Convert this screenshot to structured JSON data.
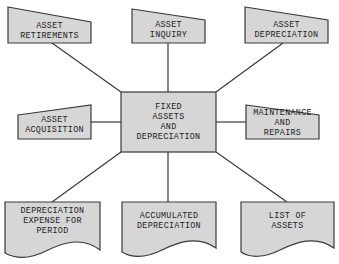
{
  "diagram": {
    "title": "Fixed Assets and Depreciation",
    "colors": {
      "shape_fill": "#d6d6d6",
      "stroke": "#3a3a3a",
      "text": "#222222",
      "background": "#ffffff"
    },
    "center": {
      "type": "process",
      "label": "FIXED\nASSETS\nAND\nDEPRECIATION"
    },
    "inputs": [
      {
        "id": "retirements",
        "type": "manual-input",
        "label": "ASSET\nRETIREMENTS"
      },
      {
        "id": "inquiry",
        "type": "manual-input",
        "label": "ASSET\nINQUIRY"
      },
      {
        "id": "depreciation",
        "type": "manual-input",
        "label": "ASSET\nDEPRECIATION"
      },
      {
        "id": "acquisition",
        "type": "manual-input",
        "label": "ASSET\nACQUISITION"
      },
      {
        "id": "maintenance",
        "type": "manual-input",
        "label": "MAINTENANCE\nAND\nREPAIRS"
      }
    ],
    "outputs": [
      {
        "id": "expense",
        "type": "document",
        "label": "DEPRECIATION\nEXPENSE FOR\nPERIOD"
      },
      {
        "id": "accumulated",
        "type": "document",
        "label": "ACCUMULATED\nDEPRECIATION"
      },
      {
        "id": "list",
        "type": "document",
        "label": "LIST OF\nASSETS"
      }
    ],
    "edges": [
      [
        "center",
        "retirements"
      ],
      [
        "center",
        "inquiry"
      ],
      [
        "center",
        "depreciation"
      ],
      [
        "center",
        "acquisition"
      ],
      [
        "center",
        "maintenance"
      ],
      [
        "center",
        "expense"
      ],
      [
        "center",
        "accumulated"
      ],
      [
        "center",
        "list"
      ]
    ]
  }
}
